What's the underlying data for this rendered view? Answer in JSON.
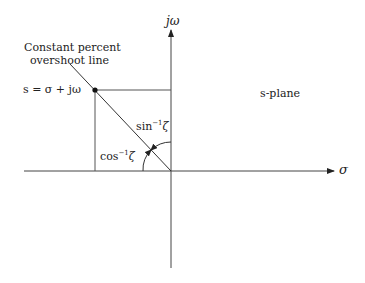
{
  "diagram": {
    "axes": {
      "imag_label": "jω",
      "real_label": "σ"
    },
    "plane_label": "s-plane",
    "annotation": {
      "line1": "Constant percent",
      "line2": "overshoot line"
    },
    "point_label": "s = σ + jω",
    "angles": {
      "sin_label": "sin",
      "sin_exp": "−1",
      "sin_var": "ζ",
      "cos_label": "cos",
      "cos_exp": "−1",
      "cos_var": "ζ"
    },
    "colors": {
      "line": "#333333",
      "background": "#ffffff"
    }
  }
}
